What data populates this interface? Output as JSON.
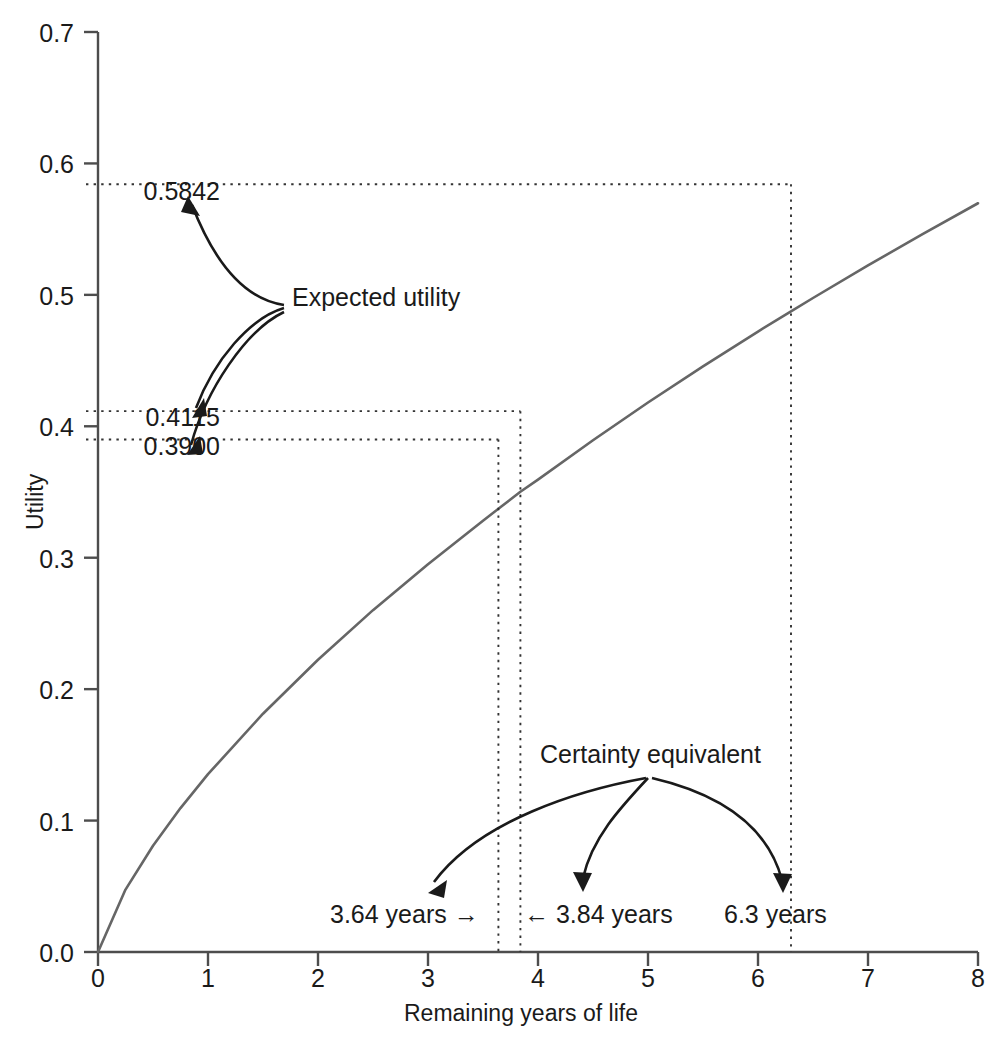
{
  "chart_data": {
    "type": "line",
    "title": "",
    "xlabel": "Remaining years of life",
    "ylabel": "Utility",
    "xlim": [
      0,
      8
    ],
    "ylim": [
      0.0,
      0.7
    ],
    "grid": false,
    "legend": "none",
    "x_ticks": [
      "0",
      "1",
      "2",
      "3",
      "4",
      "5",
      "6",
      "7",
      "8"
    ],
    "y_ticks": [
      "0.0",
      "0.1",
      "0.2",
      "0.3",
      "0.4",
      "0.5",
      "0.6",
      "0.7"
    ],
    "series": [
      {
        "name": "Utility function",
        "color": "#666666",
        "x": [
          0,
          0.25,
          0.5,
          0.75,
          1,
          1.5,
          2,
          2.5,
          3,
          3.5,
          3.64,
          3.84,
          4,
          4.5,
          5,
          5.5,
          6,
          6.3,
          6.5,
          7,
          7.5,
          8
        ],
        "y": [
          0.0,
          0.0475,
          0.0808,
          0.1095,
          0.1353,
          0.1813,
          0.2224,
          0.2601,
          0.2951,
          0.3281,
          0.3372,
          0.3502,
          0.3594,
          0.3894,
          0.4181,
          0.4456,
          0.4721,
          0.4875,
          0.4976,
          0.5224,
          0.5464,
          0.5697
        ]
      }
    ],
    "annotations": {
      "expected_utility_label": "Expected utility",
      "certainty_equivalent_label": "Certainty equivalent",
      "utility_values": [
        {
          "value": "0.5842",
          "y": 0.5842,
          "x_year": 6.3
        },
        {
          "value": "0.4115",
          "y": 0.4115,
          "x_year": 3.84
        },
        {
          "value": "0.3900",
          "y": 0.39,
          "x_year": 3.64
        }
      ],
      "year_values": [
        {
          "label": "3.64 years →",
          "value": 3.64
        },
        {
          "label": "← 3.84 years",
          "value": 3.84
        },
        {
          "label": "6.3 years",
          "value": 6.3
        }
      ]
    },
    "colors": {
      "curve": "#666666",
      "axis": "#4d4d4d",
      "annotation": "#1a1a1a",
      "dotted_guide": "#333333",
      "background": "#ffffff"
    }
  }
}
